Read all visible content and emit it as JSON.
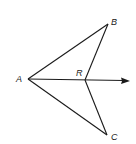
{
  "diagram": {
    "type": "geometry",
    "points": {
      "A": {
        "label": "A",
        "x": 28,
        "y": 79
      },
      "B": {
        "label": "B",
        "x": 108,
        "y": 24
      },
      "C": {
        "label": "C",
        "x": 107,
        "y": 135
      },
      "R": {
        "label": "R",
        "x": 85,
        "y": 80
      }
    },
    "segments": [
      "AB",
      "BR",
      "AC",
      "CR"
    ],
    "rays": [
      {
        "from": "A",
        "through": "R",
        "label": "ray AR"
      }
    ],
    "colors": {
      "stroke": "#1a1a1a",
      "background": "#ffffff"
    }
  }
}
